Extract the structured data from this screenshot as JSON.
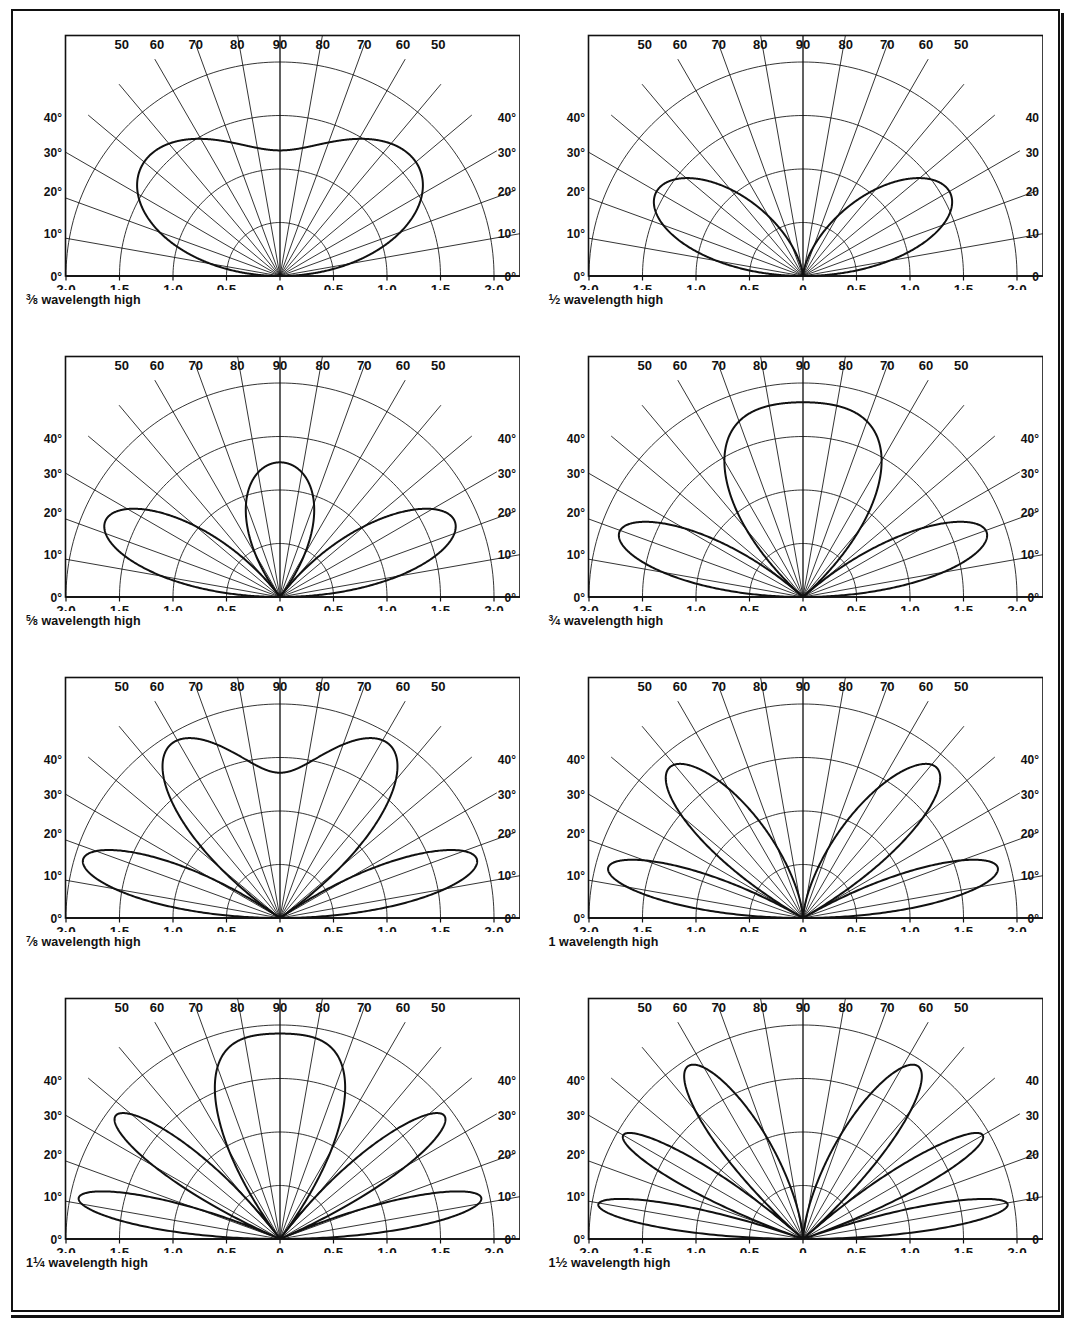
{
  "figure": {
    "panel_rows": 4,
    "panel_cols": 2,
    "ink_color": "#111111"
  },
  "axis": {
    "x_ticks": [
      "2·0",
      "1·5",
      "1·0",
      "0·5",
      "0",
      "0·5",
      "1·0",
      "1·5",
      "2·0"
    ],
    "x_tick_values": [
      -2.0,
      -1.5,
      -1.0,
      -0.5,
      0,
      0.5,
      1.0,
      1.5,
      2.0
    ],
    "elevation_left": [
      "0°",
      "10°",
      "20°",
      "30°",
      "40°"
    ],
    "elevation_right": [
      "0°",
      "10°",
      "20°",
      "30°",
      "40°"
    ],
    "elevation_right_plain": [
      "0",
      "10",
      "20",
      "30",
      "40"
    ],
    "elevation_top": [
      "50",
      "60",
      "70",
      "80",
      "90",
      "80",
      "70",
      "60",
      "50"
    ],
    "elevation_values": [
      0,
      10,
      20,
      30,
      40,
      50,
      60,
      70,
      80,
      90
    ],
    "radial_rings": [
      0.5,
      1.0,
      1.5,
      2.0
    ],
    "radius_max": 2.0,
    "grid": "polar-half"
  },
  "chart_data": {
    "type": "line",
    "subtype": "polar-half-plane-radiation-pattern",
    "xlabel": "",
    "ylabel": "",
    "xlim": [
      -2.0,
      2.0
    ],
    "rlim": [
      0,
      2.0
    ],
    "angle_range_deg": [
      0,
      180
    ],
    "legend": "none",
    "grid": true,
    "series": [
      {
        "name": "3/8 wavelength high",
        "height_wavelengths": 0.375,
        "lobe_count_per_side": 1,
        "peak_elevation_deg": [
          33
        ],
        "peak_radius": [
          1.66
        ],
        "null_elevation_deg": [
          0
        ],
        "zenith_radius": 1.6,
        "inner_ring_radius": 0.62
      },
      {
        "name": "1/2 wavelength high",
        "height_wavelengths": 0.5,
        "lobe_count_per_side": 1,
        "peak_elevation_deg": [
          27
        ],
        "peak_radius": [
          1.58
        ],
        "null_elevation_deg": [
          0
        ],
        "zenith_radius": 0.92,
        "inner_ring_radius": 0.54
      },
      {
        "name": "5/8 wavelength high",
        "height_wavelengths": 0.625,
        "lobe_count_per_side": 2,
        "peak_elevation_deg": [
          22,
          90
        ],
        "peak_radius": [
          1.78,
          1.1
        ],
        "null_elevation_deg": [
          0,
          53
        ],
        "zenith_radius": 1.1,
        "inner_ring_radius": 0.5
      },
      {
        "name": "3/4 wavelength high",
        "height_wavelengths": 0.75,
        "lobe_count_per_side": 2,
        "peak_elevation_deg": [
          20,
          90
        ],
        "peak_radius": [
          1.82,
          1.98
        ],
        "null_elevation_deg": [
          0,
          42
        ],
        "zenith_radius": 1.98,
        "inner_ring_radius": 0.48
      },
      {
        "name": "7/8 wavelength high",
        "height_wavelengths": 0.875,
        "lobe_count_per_side": 2,
        "peak_elevation_deg": [
          14,
          55
        ],
        "peak_radius": [
          1.92,
          1.9
        ],
        "null_elevation_deg": [
          0,
          35
        ],
        "zenith_radius": 1.56,
        "inner_ring_radius": 0.52
      },
      {
        "name": "1 wavelength high",
        "height_wavelengths": 1.0,
        "lobe_count_per_side": 2,
        "peak_elevation_deg": [
          14,
          48
        ],
        "peak_radius": [
          1.88,
          1.6
        ],
        "null_elevation_deg": [
          0,
          30,
          90
        ],
        "zenith_radius": 0.0,
        "inner_ring_radius": 0.5
      },
      {
        "name": "1 1/4 wavelength high",
        "height_wavelengths": 1.25,
        "lobe_count_per_side": 3,
        "peak_elevation_deg": [
          11,
          36,
          90
        ],
        "peak_radius": [
          1.92,
          1.72,
          2.0
        ],
        "null_elevation_deg": [
          0,
          23,
          53
        ],
        "zenith_radius": 2.0,
        "inner_ring_radius": 0.48
      },
      {
        "name": "1 1/2 wavelength high",
        "height_wavelengths": 1.5,
        "lobe_count_per_side": 3,
        "peak_elevation_deg": [
          9,
          30,
          62
        ],
        "peak_radius": [
          1.94,
          1.82,
          1.58
        ],
        "null_elevation_deg": [
          0,
          19,
          42,
          90
        ],
        "zenith_radius": 0.0,
        "inner_ring_radius": 0.46
      }
    ]
  },
  "panels": [
    {
      "id": "panel-3-8",
      "caption_numerator": "3",
      "caption_denominator": "8",
      "caption_whole": "",
      "caption_tail": " wavelength high",
      "caption_plain": "3/8 wavelength high",
      "height_wavelengths": 0.375,
      "right_labels_have_degree": true
    },
    {
      "id": "panel-1-2",
      "caption_numerator": "1",
      "caption_denominator": "2",
      "caption_whole": "",
      "caption_tail": " wavelength high",
      "caption_plain": "1/2 wavelength high",
      "height_wavelengths": 0.5,
      "right_labels_have_degree": false
    },
    {
      "id": "panel-5-8",
      "caption_numerator": "5",
      "caption_denominator": "8",
      "caption_whole": "",
      "caption_tail": " wavelength high",
      "caption_plain": "5/8 wavelength high",
      "height_wavelengths": 0.625,
      "right_labels_have_degree": true
    },
    {
      "id": "panel-3-4",
      "caption_numerator": "3",
      "caption_denominator": "4",
      "caption_whole": "",
      "caption_tail": " wavelength high",
      "caption_plain": "3/4 wavelength high",
      "height_wavelengths": 0.75,
      "right_labels_have_degree": true
    },
    {
      "id": "panel-7-8",
      "caption_numerator": "7",
      "caption_denominator": "8",
      "caption_whole": "",
      "caption_tail": " wavelength high",
      "caption_plain": "7/8 wavelength high",
      "height_wavelengths": 0.875,
      "right_labels_have_degree": true
    },
    {
      "id": "panel-1",
      "caption_numerator": "",
      "caption_denominator": "",
      "caption_whole": "1",
      "caption_tail": " wavelength high",
      "caption_plain": "1 wavelength high",
      "height_wavelengths": 1.0,
      "right_labels_have_degree": true
    },
    {
      "id": "panel-1-1-4",
      "caption_numerator": "1",
      "caption_denominator": "4",
      "caption_whole": "1",
      "caption_tail": " wavelength high",
      "caption_plain": "1 1/4 wavelength high",
      "height_wavelengths": 1.25,
      "right_labels_have_degree": true
    },
    {
      "id": "panel-1-1-2",
      "caption_numerator": "1",
      "caption_denominator": "2",
      "caption_whole": "1",
      "caption_tail": " wavelength high",
      "caption_plain": "1 1/2 wavelength high",
      "height_wavelengths": 1.5,
      "right_labels_have_degree": false
    }
  ]
}
